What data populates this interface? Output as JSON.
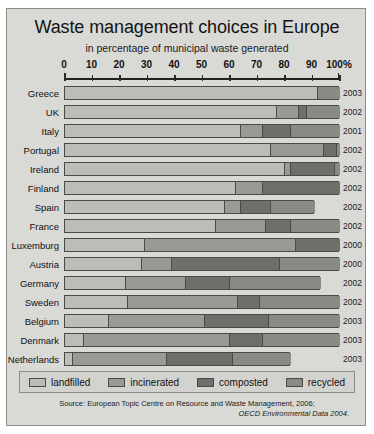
{
  "chart_data": {
    "type": "bar",
    "orientation": "horizontal",
    "stacked": true,
    "title": "Waste management choices in Europe",
    "subtitle": "in percentage of municipal waste generated",
    "xlabel": "",
    "ylabel": "",
    "xlim": [
      0,
      100
    ],
    "xtick_labels": [
      "0",
      "10",
      "20",
      "30",
      "40",
      "50",
      "60",
      "70",
      "80",
      "90",
      "100%"
    ],
    "xticks": [
      0,
      10,
      20,
      30,
      40,
      50,
      60,
      70,
      80,
      90,
      100
    ],
    "grid": false,
    "legend_position": "bottom",
    "legend": [
      "landfilled",
      "incinerated",
      "composted",
      "recycled"
    ],
    "series": [
      {
        "name": "landfilled",
        "color": "#bdbdb8",
        "values": [
          92,
          77,
          64,
          75,
          80,
          62,
          58,
          55,
          29,
          28,
          22,
          23,
          16,
          7,
          3
        ]
      },
      {
        "name": "incinerated",
        "color": "#9a9a95",
        "values": [
          0,
          8,
          8,
          19,
          2,
          10,
          6,
          18,
          55,
          11,
          22,
          40,
          35,
          53,
          34
        ]
      },
      {
        "name": "composted",
        "color": "#6e6e6a",
        "values": [
          0,
          3,
          10,
          5,
          16,
          28,
          11,
          9,
          16,
          39,
          16,
          8,
          23,
          12,
          24
        ]
      },
      {
        "name": "recycled",
        "color": "#8a8a85",
        "values": [
          8,
          12,
          18,
          1,
          2,
          0,
          16,
          18,
          0,
          22,
          33,
          29,
          26,
          28,
          21
        ]
      }
    ],
    "categories": [
      "Greece",
      "UK",
      "Italy",
      "Portugal",
      "Ireland",
      "Finland",
      "Spain",
      "France",
      "Luxemburg",
      "Austria",
      "Germany",
      "Sweden",
      "Belgium",
      "Denmark",
      "Netherlands"
    ],
    "years": [
      "2003",
      "2002",
      "2001",
      "2002",
      "2002",
      "2002",
      "2002",
      "2002",
      "2000",
      "2000",
      "2002",
      "2002",
      "2003",
      "2003",
      "2003"
    ]
  },
  "source": {
    "line1": "Source: European Topic Centre on Resource and Waste Management, 2006;",
    "line2": "OECD Environmental Data 2004."
  },
  "colors": {
    "panel_bg": "#d9d9d6",
    "legend_bg": "#d2d2ce",
    "bar_outline": "#4a4a4a",
    "axis": "#222222"
  }
}
